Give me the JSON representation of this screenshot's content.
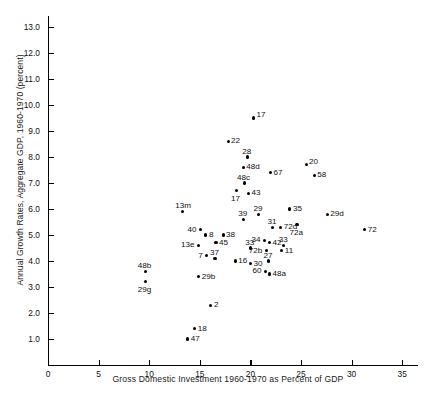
{
  "chart_data": {
    "type": "scatter",
    "title": "",
    "xlabel": "Gross Domestic Investment 1960-1970 as Percent of GDP",
    "ylabel": "Annual Growth Rates, Aggregate GDP, 1960-1970 (percent)",
    "xlim": [
      0,
      36.6
    ],
    "ylim": [
      0,
      13.8
    ],
    "xticks": [
      0,
      5,
      10,
      15,
      20,
      25,
      30,
      35
    ],
    "xtick_labels": [
      "0",
      "5",
      "10",
      "15",
      "20",
      "25",
      "30",
      "35"
    ],
    "yticks": [
      1.0,
      2.0,
      3.0,
      4.0,
      5.0,
      6.0,
      7.0,
      8.0,
      9.0,
      10.0,
      11.0,
      12.0,
      13.0
    ],
    "ytick_labels": [
      "1.0",
      "2.0",
      "3.0",
      "4.0",
      "5.0",
      "6.0",
      "7.0",
      "8.0",
      "9.0",
      "10.0",
      "11.0",
      "12.0",
      "13.0"
    ],
    "grid": false,
    "legend": null,
    "marker": "filled-circle",
    "points": [
      {
        "label": "17",
        "x": 20.3,
        "y": 9.5,
        "lx": "right",
        "ly": "up"
      },
      {
        "label": "22",
        "x": 17.8,
        "y": 8.6,
        "lx": "right",
        "ly": "mid"
      },
      {
        "label": "28",
        "x": 19.7,
        "y": 8.0,
        "lx": "center",
        "ly": "above"
      },
      {
        "label": "48d",
        "x": 19.3,
        "y": 7.6,
        "lx": "right",
        "ly": "mid"
      },
      {
        "label": "67",
        "x": 22.0,
        "y": 7.4,
        "lx": "right",
        "ly": "mid"
      },
      {
        "label": "20",
        "x": 25.5,
        "y": 7.7,
        "lx": "right",
        "ly": "up"
      },
      {
        "label": "58",
        "x": 26.3,
        "y": 7.3,
        "lx": "right",
        "ly": "mid"
      },
      {
        "label": "48c",
        "x": 19.4,
        "y": 7.0,
        "lx": "center",
        "ly": "above"
      },
      {
        "label": "43",
        "x": 19.8,
        "y": 6.6,
        "lx": "right",
        "ly": "mid"
      },
      {
        "label": "17",
        "x": 18.6,
        "y": 6.7,
        "lx": "center",
        "ly": "below"
      },
      {
        "label": "35",
        "x": 23.9,
        "y": 6.0,
        "lx": "right",
        "ly": "mid"
      },
      {
        "label": "29d",
        "x": 27.6,
        "y": 5.8,
        "lx": "right",
        "ly": "mid"
      },
      {
        "label": "13m",
        "x": 13.3,
        "y": 5.9,
        "lx": "center",
        "ly": "above"
      },
      {
        "label": "29",
        "x": 20.8,
        "y": 5.8,
        "lx": "center",
        "ly": "above"
      },
      {
        "label": "39",
        "x": 19.3,
        "y": 5.6,
        "lx": "center",
        "ly": "above"
      },
      {
        "label": "31",
        "x": 22.2,
        "y": 5.3,
        "lx": "center",
        "ly": "above"
      },
      {
        "label": "72a",
        "x": 24.6,
        "y": 5.4,
        "lx": "center",
        "ly": "below"
      },
      {
        "label": "72",
        "x": 31.3,
        "y": 5.2,
        "lx": "right",
        "ly": "mid"
      },
      {
        "label": "40",
        "x": 15.1,
        "y": 5.2,
        "lx": "left",
        "ly": "mid"
      },
      {
        "label": "8",
        "x": 15.6,
        "y": 5.0,
        "lx": "right",
        "ly": "mid"
      },
      {
        "label": "38",
        "x": 17.3,
        "y": 5.0,
        "lx": "right",
        "ly": "mid"
      },
      {
        "label": "72d",
        "x": 23.0,
        "y": 5.3,
        "lx": "right",
        "ly": "mid"
      },
      {
        "label": "34",
        "x": 21.4,
        "y": 4.8,
        "lx": "left",
        "ly": "mid"
      },
      {
        "label": "42",
        "x": 21.9,
        "y": 4.7,
        "lx": "right",
        "ly": "mid"
      },
      {
        "label": "13e",
        "x": 14.9,
        "y": 4.6,
        "lx": "left",
        "ly": "mid"
      },
      {
        "label": "45",
        "x": 16.6,
        "y": 4.7,
        "lx": "right",
        "ly": "mid"
      },
      {
        "label": "33",
        "x": 20.0,
        "y": 4.5,
        "lx": "center",
        "ly": "above"
      },
      {
        "label": "11",
        "x": 23.1,
        "y": 4.4,
        "lx": "right",
        "ly": "mid"
      },
      {
        "label": "72b",
        "x": 21.6,
        "y": 4.4,
        "lx": "left",
        "ly": "mid"
      },
      {
        "label": "33",
        "x": 23.3,
        "y": 4.6,
        "lx": "center",
        "ly": "above"
      },
      {
        "label": "7",
        "x": 15.7,
        "y": 4.2,
        "lx": "left",
        "ly": "mid"
      },
      {
        "label": "37",
        "x": 16.5,
        "y": 4.1,
        "lx": "center",
        "ly": "above"
      },
      {
        "label": "16",
        "x": 18.5,
        "y": 4.0,
        "lx": "right",
        "ly": "mid"
      },
      {
        "label": "30",
        "x": 20.0,
        "y": 3.9,
        "lx": "right",
        "ly": "mid"
      },
      {
        "label": "27",
        "x": 21.8,
        "y": 4.0,
        "lx": "center",
        "ly": "above"
      },
      {
        "label": "60",
        "x": 21.5,
        "y": 3.6,
        "lx": "left",
        "ly": "mid"
      },
      {
        "label": "48a",
        "x": 21.9,
        "y": 3.5,
        "lx": "right",
        "ly": "mid"
      },
      {
        "label": "29b",
        "x": 14.9,
        "y": 3.4,
        "lx": "right",
        "ly": "mid"
      },
      {
        "label": "48b",
        "x": 9.6,
        "y": 3.6,
        "lx": "center",
        "ly": "above"
      },
      {
        "label": "29g",
        "x": 9.6,
        "y": 3.2,
        "lx": "center",
        "ly": "below"
      },
      {
        "label": "2",
        "x": 16.1,
        "y": 2.3,
        "lx": "right",
        "ly": "mid"
      },
      {
        "label": "18",
        "x": 14.5,
        "y": 1.4,
        "lx": "right",
        "ly": "mid"
      },
      {
        "label": "47",
        "x": 13.8,
        "y": 1.0,
        "lx": "right",
        "ly": "mid"
      }
    ]
  }
}
